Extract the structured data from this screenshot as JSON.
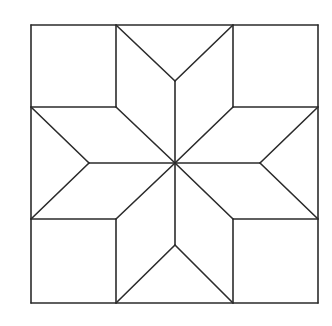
{
  "diagram": {
    "title": "Eight-pointed star quilt block",
    "stroke_color": "#2b2b2b",
    "background": "#ffffff",
    "outer_square": {
      "x1": 31,
      "y1": 25,
      "x2": 318,
      "y2": 303
    },
    "center": {
      "x": 175,
      "y": 163
    },
    "corner_squares": [
      {
        "name": "top-left",
        "x": 31,
        "y": 25,
        "w": 85,
        "h": 82
      },
      {
        "name": "top-right",
        "x": 233,
        "y": 25,
        "w": 85,
        "h": 82
      },
      {
        "name": "bottom-left",
        "x": 31,
        "y": 219,
        "w": 85,
        "h": 84
      },
      {
        "name": "bottom-right",
        "x": 233,
        "y": 219,
        "w": 85,
        "h": 84
      }
    ],
    "edge_apexes": {
      "top": {
        "x": 175,
        "y": 81
      },
      "bottom": {
        "x": 175,
        "y": 245
      },
      "left": {
        "x": 89,
        "y": 163
      },
      "right": {
        "x": 260,
        "y": 163
      }
    },
    "segments": [
      [
        31,
        25,
        318,
        25
      ],
      [
        318,
        25,
        318,
        303
      ],
      [
        318,
        303,
        31,
        303
      ],
      [
        31,
        303,
        31,
        25
      ],
      [
        116,
        25,
        116,
        107
      ],
      [
        31,
        107,
        116,
        107
      ],
      [
        233,
        25,
        233,
        107
      ],
      [
        233,
        107,
        318,
        107
      ],
      [
        31,
        219,
        116,
        219
      ],
      [
        116,
        219,
        116,
        303
      ],
      [
        233,
        219,
        318,
        219
      ],
      [
        233,
        219,
        233,
        303
      ],
      [
        116,
        25,
        175,
        81
      ],
      [
        233,
        25,
        175,
        81
      ],
      [
        175,
        81,
        175,
        163
      ],
      [
        116,
        303,
        175,
        245
      ],
      [
        233,
        303,
        175,
        245
      ],
      [
        175,
        245,
        175,
        163
      ],
      [
        31,
        107,
        89,
        163
      ],
      [
        31,
        219,
        89,
        163
      ],
      [
        89,
        163,
        175,
        163
      ],
      [
        318,
        107,
        260,
        163
      ],
      [
        318,
        219,
        260,
        163
      ],
      [
        260,
        163,
        175,
        163
      ],
      [
        116,
        107,
        175,
        163
      ],
      [
        233,
        107,
        175,
        163
      ],
      [
        116,
        219,
        175,
        163
      ],
      [
        233,
        219,
        175,
        163
      ]
    ]
  }
}
